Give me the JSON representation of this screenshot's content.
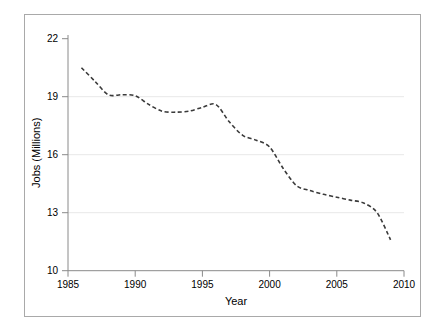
{
  "chart_data": {
    "type": "line",
    "title": "",
    "xlabel": "Year",
    "ylabel": "Jobs (Millions)",
    "xlim": [
      1985,
      2010
    ],
    "ylim": [
      10,
      22
    ],
    "xticks": [
      1985,
      1990,
      1995,
      2000,
      2005,
      2010
    ],
    "yticks": [
      10,
      13,
      16,
      19,
      22
    ],
    "grid": "horizontal gridlines at 13, 16, 19",
    "legend": "none",
    "line_style": "dashed",
    "line_color": "#3a3a3a",
    "series": [
      {
        "name": "Jobs",
        "x": [
          1986,
          1987,
          1988,
          1989,
          1990,
          1991,
          1992,
          1993,
          1994,
          1995,
          1996,
          1997,
          1998,
          1999,
          2000,
          2001,
          2002,
          2003,
          2004,
          2005,
          2006,
          2007,
          2008,
          2009
        ],
        "values": [
          20.5,
          19.8,
          19.1,
          19.1,
          19.05,
          18.6,
          18.25,
          18.2,
          18.25,
          18.45,
          18.6,
          17.7,
          17.0,
          16.75,
          16.4,
          15.3,
          14.4,
          14.15,
          13.95,
          13.8,
          13.65,
          13.5,
          13.0,
          11.6
        ]
      }
    ]
  },
  "axis": {
    "y_tick_labels": [
      "22",
      "19",
      "16",
      "13",
      "10"
    ],
    "x_tick_labels": [
      "1985",
      "1990",
      "1995",
      "2000",
      "2005",
      "2010"
    ],
    "y_title": "Jobs (Millions)",
    "x_title": "Year"
  }
}
